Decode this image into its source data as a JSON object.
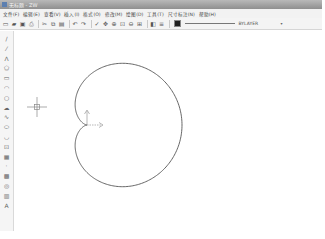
{
  "window": {
    "title": "无标题 - ZW",
    "app_icon": "app-icon"
  },
  "menubar": {
    "items": [
      {
        "label": "文件(F)"
      },
      {
        "label": "编辑(E)"
      },
      {
        "label": "查看(V)"
      },
      {
        "label": "插入(I)"
      },
      {
        "label": "格式(O)"
      },
      {
        "label": "修改(M)"
      },
      {
        "label": "绘图(D)"
      },
      {
        "label": "工具(T)"
      },
      {
        "label": "尺寸标注(N)"
      },
      {
        "label": "帮助(H)"
      }
    ]
  },
  "toolbar": {
    "buttons": [
      {
        "name": "new-file-icon",
        "glyph": "▭"
      },
      {
        "name": "open-file-icon",
        "glyph": "▰"
      },
      {
        "name": "save-icon",
        "glyph": "▣"
      },
      {
        "name": "print-icon",
        "glyph": "⎙"
      },
      {
        "name": "cut-icon",
        "glyph": "✂"
      },
      {
        "name": "copy-icon",
        "glyph": "⧉"
      },
      {
        "name": "paste-icon",
        "glyph": "▤"
      },
      {
        "name": "undo-icon",
        "glyph": "↶"
      },
      {
        "name": "redo-icon",
        "glyph": "↷"
      },
      {
        "name": "match-properties-icon",
        "glyph": "✓"
      },
      {
        "name": "pan-icon",
        "glyph": "✥"
      },
      {
        "name": "zoom-realtime-icon",
        "glyph": "⊕"
      },
      {
        "name": "zoom-window-icon",
        "glyph": "⊡"
      },
      {
        "name": "zoom-previous-icon",
        "glyph": "⊖"
      },
      {
        "name": "zoom-extents-icon",
        "glyph": "⊞"
      },
      {
        "name": "layers-icon",
        "glyph": "◧"
      },
      {
        "name": "layer-states-icon",
        "glyph": "≡"
      }
    ],
    "color_swatch": "#222222",
    "linetype_label": "BYLAYER",
    "dropdown_arrow": "▾"
  },
  "left_toolbar": {
    "buttons": [
      {
        "name": "line-icon",
        "glyph": "/"
      },
      {
        "name": "construction-line-icon",
        "glyph": "⁄"
      },
      {
        "name": "polyline-icon",
        "glyph": "ᐱ"
      },
      {
        "name": "polygon-icon",
        "glyph": "⬠"
      },
      {
        "name": "rectangle-icon",
        "glyph": "▭"
      },
      {
        "name": "arc-icon",
        "glyph": "◠"
      },
      {
        "name": "circle-icon",
        "glyph": "○"
      },
      {
        "name": "revcloud-icon",
        "glyph": "☁"
      },
      {
        "name": "spline-icon",
        "glyph": "∿"
      },
      {
        "name": "ellipse-icon",
        "glyph": "⬭"
      },
      {
        "name": "ellipse-arc-icon",
        "glyph": "◡"
      },
      {
        "name": "insert-block-icon",
        "glyph": "⊡"
      },
      {
        "name": "make-block-icon",
        "glyph": "▦"
      },
      {
        "name": "point-icon",
        "glyph": "·"
      },
      {
        "name": "hatch-icon",
        "glyph": "▩"
      },
      {
        "name": "region-icon",
        "glyph": "◎"
      },
      {
        "name": "table-icon",
        "glyph": "▥"
      },
      {
        "name": "mtext-icon",
        "glyph": "A"
      }
    ]
  },
  "canvas": {
    "crosshair": {
      "x": 22,
      "y": 76
    },
    "ucs_icon": {
      "x": 72,
      "y": 94
    },
    "shape": {
      "type": "cardioid",
      "cusp": {
        "x": 72,
        "y": 94
      },
      "a": 47.5,
      "stroke": "#555555"
    }
  }
}
